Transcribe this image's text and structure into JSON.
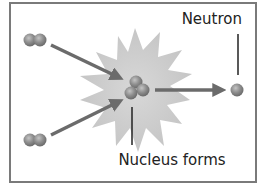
{
  "diagram": {
    "type": "nuclear-fusion",
    "labels": {
      "neutron": "Neutron",
      "nucleus": "Nucleus forms"
    },
    "colors": {
      "frame": "#7a7a7a",
      "burst": "#cfcfcf",
      "particle": "#8a8a8a",
      "arrow": "#6e6e6e",
      "text": "#222222"
    },
    "elements": [
      {
        "id": "reactant-top",
        "kind": "two-particle nucleus"
      },
      {
        "id": "reactant-bottom",
        "kind": "two-particle nucleus"
      },
      {
        "id": "product-nucleus",
        "kind": "three-particle nucleus"
      },
      {
        "id": "neutron",
        "kind": "single particle"
      }
    ]
  }
}
